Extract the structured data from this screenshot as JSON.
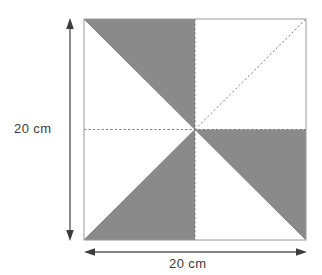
{
  "figure": {
    "shape": "square",
    "square": {
      "left": 84,
      "top": 19,
      "right": 306,
      "bottom": 240,
      "center_x": 195,
      "center_y": 129.5,
      "border_color": "#9a9a9a",
      "fill_color": "#ffffff"
    },
    "shaded_color": "#8a8a8a",
    "unshaded_color": "#ffffff",
    "dash_color": "#6e6e6e",
    "arrow_color": "#4a4a4a",
    "text_color": "#3b3b3b",
    "quadrants": [
      {
        "name": "top-left",
        "shaded_half": "upper-right",
        "shaded": true,
        "points": "84,19 195,19 195,129.5"
      },
      {
        "name": "top-right",
        "shaded_half": "none",
        "shaded": false,
        "points": ""
      },
      {
        "name": "bottom-left",
        "shaded_half": "lower-right",
        "shaded": true,
        "points": "84,240 195,240 195,129.5"
      },
      {
        "name": "bottom-right",
        "shaded_half": "upper-right",
        "shaded": true,
        "points": "195,129.5 306,129.5 306,240"
      }
    ],
    "diagonals": [
      {
        "name": "main-diagonal-top-left",
        "from": "84,19",
        "to": "195,129.5",
        "style": "solid"
      },
      {
        "name": "diagonal-center-to-top-right",
        "from": "195,129.5",
        "to": "306,19",
        "style": "dashed"
      },
      {
        "name": "diagonal-center-to-bottom-left",
        "from": "84,240",
        "to": "195,129.5",
        "style": "solid"
      },
      {
        "name": "diagonal-center-to-bottom-right",
        "from": "195,129.5",
        "to": "306,240",
        "style": "solid"
      }
    ],
    "midlines": [
      {
        "name": "horizontal-midline",
        "from": "84,129.5",
        "to": "306,129.5",
        "style": "dashed"
      },
      {
        "name": "vertical-midline",
        "from": "195,19",
        "to": "195,240",
        "style": "dashed"
      }
    ]
  },
  "dimensions": {
    "height": {
      "label": "20 cm",
      "value": 20,
      "unit": "cm",
      "orientation": "vertical",
      "arrow_x": 70,
      "arrow_top": 19,
      "arrow_bottom": 240
    },
    "width": {
      "label": "20 cm",
      "value": 20,
      "unit": "cm",
      "orientation": "horizontal",
      "arrow_y": 252,
      "arrow_left": 85,
      "arrow_right": 307
    }
  }
}
